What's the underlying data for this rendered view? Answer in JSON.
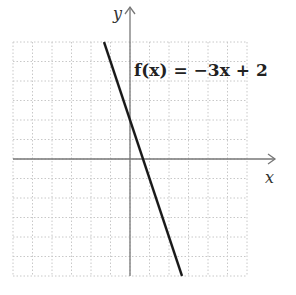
{
  "chart_data": {
    "type": "line",
    "title": "",
    "xlabel": "x",
    "ylabel": "y",
    "xlim": [
      -6,
      6
    ],
    "ylim": [
      -6,
      6
    ],
    "grid": true,
    "grid_step": 1,
    "tick_labels": false,
    "series": [
      {
        "name": "f(x) = −3x + 2",
        "equation": "f(x) = -3x + 2",
        "slope": -3,
        "intercept": 2,
        "x": [
          -1.333,
          2.667
        ],
        "y": [
          6,
          -6
        ]
      }
    ],
    "annotations": [
      {
        "text": "f(x) = −3x + 2",
        "x": 0.3,
        "y": 4.6
      }
    ],
    "legend": "none"
  },
  "labels": {
    "x_axis": "x",
    "y_axis": "y",
    "function": "f(x) = −3x + 2"
  },
  "colors": {
    "function_line": "#1a1a1a",
    "axes": "#777777",
    "grid": "#c8c8c8",
    "background": "#ffffff"
  }
}
